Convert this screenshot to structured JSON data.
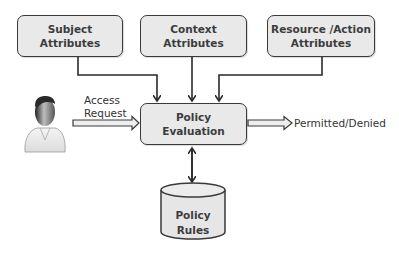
{
  "diagram": {
    "nodes": {
      "subject": {
        "line1": "Subject",
        "line2": "Attributes"
      },
      "context": {
        "line1": "Context",
        "line2": "Attributes"
      },
      "resource": {
        "line1": "Resource /Action",
        "line2": "Attributes"
      },
      "evaluation": {
        "line1": "Policy",
        "line2": "Evaluation"
      },
      "rules": {
        "line1": "Policy",
        "line2": "Rules"
      },
      "user": {
        "icon": "person-icon"
      }
    },
    "edges": {
      "access_request": {
        "line1": "Access",
        "line2": "Request"
      },
      "output": {
        "label": "Permitted/Denied"
      }
    },
    "colors": {
      "box_fill": "#e9e9e9",
      "stroke": "#3a3a3a",
      "text": "#3c3c3c"
    }
  }
}
